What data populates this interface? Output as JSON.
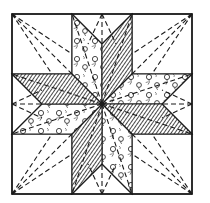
{
  "diagram": {
    "type": "LeMoyne star quilt block pattern",
    "colors": {
      "ink": "#1a1a1a",
      "background": "#ffffff",
      "hatch": "#2b2b2b"
    },
    "block": {
      "x": 12,
      "y": 14,
      "size": 180,
      "center": [
        102,
        104
      ]
    },
    "diamonds": [
      {
        "id": "top-left",
        "fabric": "floral",
        "tip": [
          72,
          14
        ]
      },
      {
        "id": "top-right",
        "fabric": "hatched",
        "tip": [
          132,
          14
        ]
      },
      {
        "id": "right-top",
        "fabric": "floral",
        "tip": [
          192,
          74
        ]
      },
      {
        "id": "right-bottom",
        "fabric": "hatched",
        "tip": [
          192,
          134
        ]
      },
      {
        "id": "bottom-right",
        "fabric": "floral",
        "tip": [
          132,
          194
        ]
      },
      {
        "id": "bottom-left",
        "fabric": "hatched",
        "tip": [
          72,
          194
        ]
      },
      {
        "id": "left-bottom",
        "fabric": "floral",
        "tip": [
          12,
          134
        ]
      },
      {
        "id": "left-top",
        "fabric": "hatched",
        "tip": [
          12,
          74
        ]
      }
    ],
    "corner_squares": 4,
    "side_triangles": 4,
    "quilting_lines": "dashed"
  }
}
